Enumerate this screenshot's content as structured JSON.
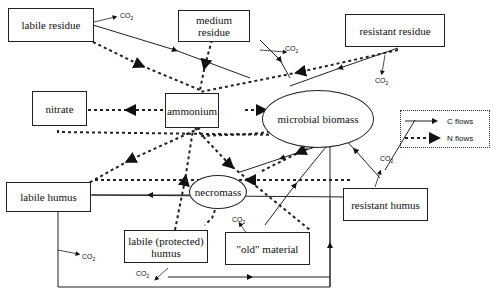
{
  "nodes": {
    "labile_residue": "labile residue",
    "medium_residue": "medium residue",
    "resistant_residue": "resistant residue",
    "nitrate": "nitrate",
    "ammonium": "ammonium",
    "microbial_biomass": "microbial biomass",
    "labile_humus": "labile humus",
    "necromass": "necromass",
    "resistant_humus": "resistant humus",
    "labile_protected_humus": "labile (protected) humus",
    "old_material": "\"old\" material"
  },
  "co2_label": "CO",
  "co2_sub": "2",
  "legend": {
    "c_flows": "C flows",
    "n_flows": "N flows"
  }
}
